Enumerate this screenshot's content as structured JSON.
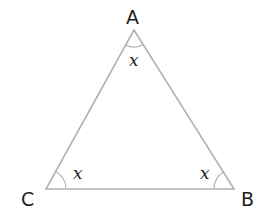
{
  "diagram": {
    "type": "triangle",
    "colors": {
      "line": "#b3b3b3",
      "text": "#1e1e1e",
      "background": "#ffffff"
    },
    "vertices": [
      {
        "id": "A",
        "label": "A",
        "x": 134,
        "y": 30
      },
      {
        "id": "B",
        "label": "B",
        "x": 234,
        "y": 189
      },
      {
        "id": "C",
        "label": "C",
        "x": 46,
        "y": 189
      }
    ],
    "edges": [
      {
        "from": "A",
        "to": "B"
      },
      {
        "from": "B",
        "to": "C"
      },
      {
        "from": "C",
        "to": "A"
      }
    ],
    "angles": [
      {
        "vertex": "A",
        "label": "x"
      },
      {
        "vertex": "B",
        "label": "x"
      },
      {
        "vertex": "C",
        "label": "x"
      }
    ]
  }
}
